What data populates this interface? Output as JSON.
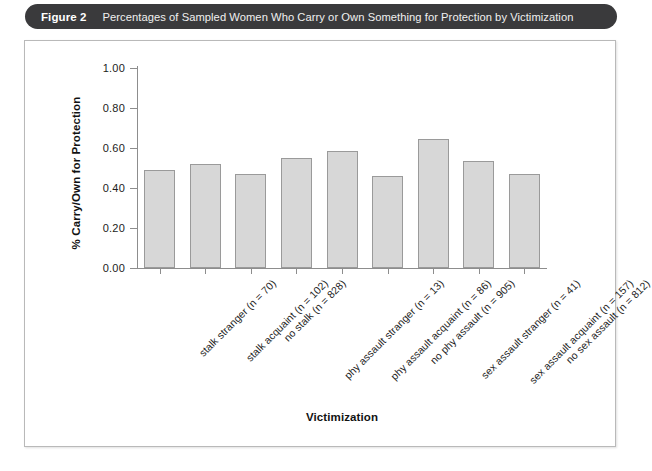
{
  "caption": {
    "figure_number": "Figure 2",
    "title": "Percentages of Sampled Women Who Carry or Own Something for Protection by Victimization"
  },
  "chart_data": {
    "type": "bar",
    "title": "",
    "xlabel": "Victimization",
    "ylabel": "% Carry/Own for Protection",
    "ylim": [
      0.0,
      1.0
    ],
    "yticks": [
      "0.00",
      "0.20",
      "0.40",
      "0.60",
      "0.80",
      "1.00"
    ],
    "ytick_values": [
      0.0,
      0.2,
      0.4,
      0.6,
      0.8,
      1.0
    ],
    "grid": false,
    "legend": null,
    "bar_fill_color": "#d7d7d7",
    "bar_edge_color": "#9a9a9a",
    "categories": [
      "stalk stranger (n = 70)",
      "stalk acquaint (n = 102)",
      "no stalk (n = 828)",
      "phy assault stranger (n = 13)",
      "phy assault acquaint (n = 86)",
      "no phy assault (n = 905)",
      "sex assault stranger (n = 41)",
      "sex assault acquaint (n = 157)",
      "no sex assault (n = 812)"
    ],
    "values": [
      0.49,
      0.52,
      0.47,
      0.55,
      0.585,
      0.46,
      0.645,
      0.535,
      0.47
    ]
  }
}
